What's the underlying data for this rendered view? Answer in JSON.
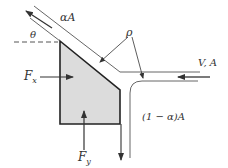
{
  "diagram": {
    "colors": {
      "plate_fill": "#dcdcdc",
      "plate_stroke": "#222222",
      "jet_line": "#555555",
      "arrow": "#333333",
      "text": "#333333"
    },
    "labels": {
      "upper_jet": "αA",
      "angle": "θ",
      "density": "ρ",
      "incoming_jet": "V, A",
      "lower_jet": "(1 − α)A",
      "force_x": "F",
      "force_x_sub": "x",
      "force_y": "F",
      "force_y_sub": "y"
    }
  }
}
